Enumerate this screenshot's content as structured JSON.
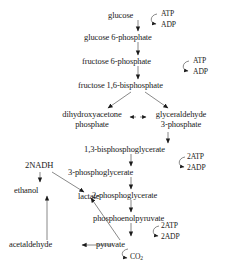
{
  "diagram": {
    "ink_color": "#1a1a1a",
    "background": "#ffffff",
    "metabolites": {
      "glucose": "glucose",
      "glucose6p": "glucose 6-phosphate",
      "fructose6p": "fructose 6-phosphate",
      "fructose16bp": "fructose 1,6-bisphosphate",
      "dhap_line1": "dihydroxyacetone",
      "dhap_line2": "phosphate",
      "g3p_line1": "glyceraldehyde",
      "g3p_line2": "3-phosphate",
      "bpg13": "1,3-bisphosphoglycerate",
      "pg3": "3-phosphoglycerate",
      "pg2": "2-phosphoglycerate",
      "pep": "phosphoenolpyruvate",
      "pyruvate": "pyruvate",
      "lactate": "lactate",
      "acetaldehyde": "acetaldehyde",
      "ethanol": "ethanol",
      "nadh": "2NADH"
    },
    "cofactors": {
      "atp_hexokinase": "ATP",
      "adp_hexokinase": "ADP",
      "atp_pfk": "ATP",
      "adp_pfk": "ADP",
      "atp_pgk": "2ATP",
      "adp_pgk": "2ADP",
      "atp_pk": "2ATP",
      "adp_pk": "2ADP",
      "co2_label": "CO",
      "co2_subscript": "2"
    }
  }
}
